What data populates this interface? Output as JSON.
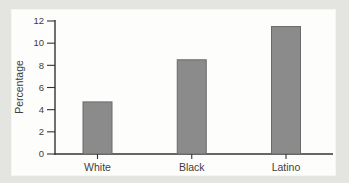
{
  "page": {
    "background_color": "#e4e4e1",
    "card_background_color": "#fdfdfc"
  },
  "chart_data": {
    "type": "bar",
    "title": "",
    "categories": [
      "White",
      "Black",
      "Latino"
    ],
    "values": [
      4.7,
      8.5,
      11.5
    ],
    "xlabel": "",
    "ylabel": "Percentage",
    "ylim": [
      0,
      12
    ],
    "y_ticks": [
      0,
      2,
      4,
      6,
      8,
      10,
      12
    ],
    "grid": false,
    "legend": false,
    "bar_color": "#8b8b8b",
    "bar_border_color": "#6a6a6a",
    "axis_color": "#333333",
    "text_color": "#3d3d3d"
  }
}
